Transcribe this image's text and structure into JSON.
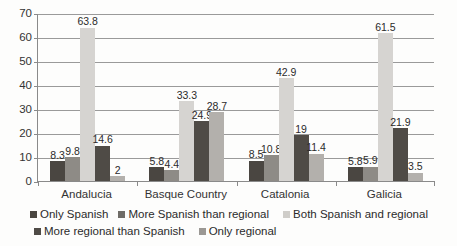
{
  "chart_data": {
    "type": "bar",
    "title": "",
    "subtitle": "",
    "xlabel": "",
    "ylabel": "",
    "ylim": [
      0,
      70
    ],
    "yticks": [
      0,
      10,
      20,
      30,
      40,
      50,
      60,
      70
    ],
    "grid": true,
    "legend_position": "bottom",
    "categories": [
      "Andalucia",
      "Basque Country",
      "Catalonia",
      "Galicia"
    ],
    "series": [
      {
        "name": "Only Spanish",
        "color": "#4a4641",
        "values": [
          8.3,
          5.8,
          8.5,
          5.8
        ],
        "labels": [
          "8.3",
          "5.8",
          "8.5",
          "5.8"
        ]
      },
      {
        "name": "More Spanish than regional",
        "color": "#8e8b86",
        "values": [
          9.8,
          4.4,
          10.8,
          5.9
        ],
        "labels": [
          "9.8",
          "4.4",
          "10.8",
          "5.9"
        ]
      },
      {
        "name": "Both Spanish and regional",
        "color": "#d6d4d1",
        "values": [
          63.8,
          33.3,
          42.9,
          61.5
        ],
        "labels": [
          "63.8",
          "33.3",
          "42.9",
          "61.5"
        ]
      },
      {
        "name": "More regional than Spanish",
        "color": "#4f4b46",
        "values": [
          14.6,
          24.9,
          19,
          21.9
        ],
        "labels": [
          "14.6",
          "24.9",
          "19",
          "21.9"
        ]
      },
      {
        "name": "Only regional",
        "color": "#b3b0ac",
        "values": [
          2,
          28.7,
          11.4,
          3.5
        ],
        "labels": [
          "2",
          "28.7",
          "11.4",
          "3.5"
        ]
      }
    ]
  },
  "legend": {
    "row1": [
      {
        "label": "Only Spanish",
        "color": "#4a4641"
      },
      {
        "label": "More Spanish than regional",
        "color": "#6f6c67"
      },
      {
        "label": "Both Spanish and regional",
        "color": "#cfcdc9"
      }
    ],
    "row2": [
      {
        "label": "More regional than Spanish",
        "color": "#4f4b46"
      },
      {
        "label": "Only regional",
        "color": "#9b9894"
      }
    ]
  }
}
